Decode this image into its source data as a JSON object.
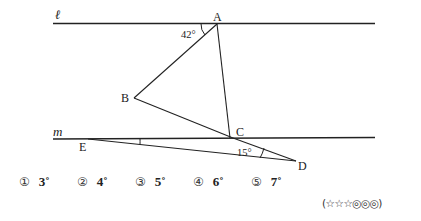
{
  "figure": {
    "lines": [
      {
        "name": "l",
        "label": "ℓ"
      },
      {
        "name": "m",
        "label": "m"
      }
    ],
    "points": {
      "A": "A",
      "B": "B",
      "C": "C",
      "D": "D",
      "E": "E"
    },
    "angles": {
      "at_A": "42°",
      "at_D": "15°"
    }
  },
  "choices": [
    {
      "num": "①",
      "value": "3˚"
    },
    {
      "num": "②",
      "value": "4˚"
    },
    {
      "num": "③",
      "value": "5˚"
    },
    {
      "num": "④",
      "value": "6˚"
    },
    {
      "num": "⑤",
      "value": "7˚"
    }
  ],
  "difficulty": "(☆☆☆◎◎◎)"
}
